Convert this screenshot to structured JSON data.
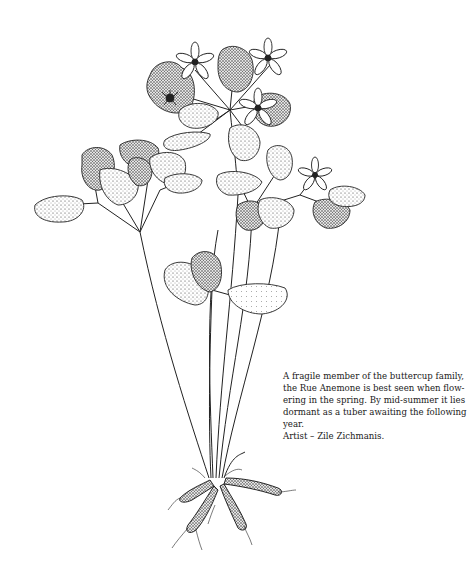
{
  "illustration": {
    "subject": "Rue Anemone",
    "description": "Stippled pen-and-ink drawing of a Rue Anemone plant with flowers, lobed leaflets, long slender stems and tuberous roots"
  },
  "caption": {
    "text": "A fragile member of the buttercup family, the Rue Anemone is best seen when flowering in the spring. By mid-summer it lies dormant as a tuber awaiting the following year.",
    "lines": [
      "A fragile member of the buttercup family,",
      "the Rue Anemone is best seen when flow-",
      "ering in the spring. By mid-summer it lies",
      "dormant as a tuber awaiting the following",
      "year."
    ],
    "credit": "Artist – Zile Zichmanis."
  },
  "colors": {
    "background": "#ffffff",
    "ink": "#1a1a1a"
  }
}
